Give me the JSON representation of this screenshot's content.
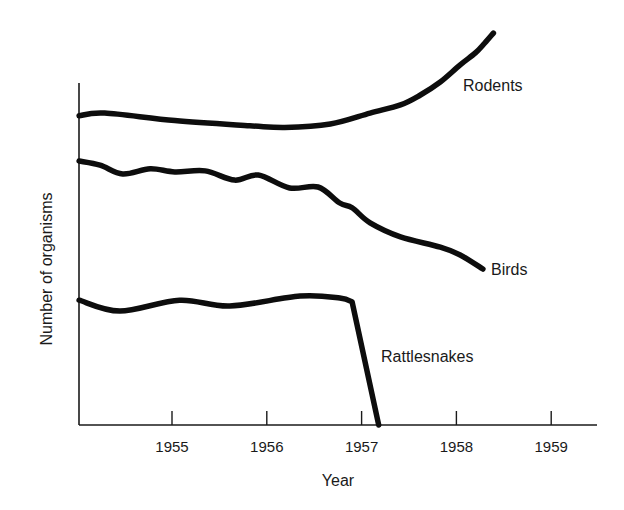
{
  "chart_data": {
    "type": "line",
    "title": "",
    "xlabel": "Year",
    "ylabel": "Number of organisms",
    "xlim": [
      1954.0,
      1959.5
    ],
    "ylim": [
      0,
      100
    ],
    "xticks": [
      1955,
      1956,
      1957,
      1958,
      1959
    ],
    "xtick_labels": [
      "1955",
      "1956",
      "1957",
      "1958",
      "1959"
    ],
    "yticks": [],
    "grid": false,
    "legend": "none (series labeled inline)",
    "series": [
      {
        "name": "Rodents",
        "x": [
          1954.02,
          1954.29,
          1955.03,
          1955.82,
          1956.19,
          1956.67,
          1957.09,
          1957.41,
          1957.62,
          1957.83,
          1958.04,
          1958.2,
          1958.3,
          1958.39
        ],
        "y": [
          90.4,
          91.2,
          89.0,
          87.5,
          87.0,
          88.0,
          91.2,
          93.6,
          96.5,
          100.3,
          105.3,
          108.8,
          111.7,
          114.6
        ]
      },
      {
        "name": "Birds",
        "x": [
          1954.02,
          1954.24,
          1954.48,
          1954.77,
          1955.03,
          1955.35,
          1955.66,
          1955.91,
          1956.24,
          1956.54,
          1956.77,
          1956.9,
          1957.09,
          1957.41,
          1957.83,
          1958.04,
          1958.28
        ],
        "y": [
          77.2,
          76.0,
          73.4,
          74.9,
          74.0,
          74.3,
          71.6,
          73.1,
          69.3,
          69.6,
          64.9,
          63.5,
          59.1,
          55.0,
          52.0,
          49.7,
          45.6
        ]
      },
      {
        "name": "Rattlesnakes",
        "x": [
          1954.02,
          1954.45,
          1955.08,
          1955.61,
          1956.35,
          1956.77,
          1956.9,
          1957.18
        ],
        "y": [
          36.5,
          33.3,
          36.5,
          34.8,
          37.7,
          37.1,
          36.0,
          0
        ]
      }
    ],
    "annotations": [
      {
        "text": "Rodents",
        "series": "Rodents"
      },
      {
        "text": "Birds",
        "series": "Birds"
      },
      {
        "text": "Rattlesnakes",
        "series": "Rattlesnakes"
      }
    ]
  }
}
